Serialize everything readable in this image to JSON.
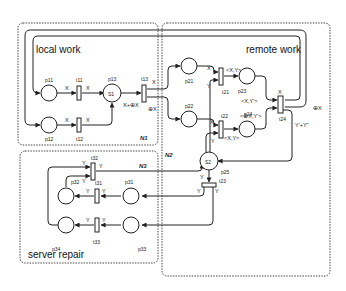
{
  "regions": {
    "local_work": "local work",
    "remote_work": "remote work",
    "server_repair": "server repair"
  },
  "nets": {
    "n1": "N1",
    "n2": "N2",
    "n3": "N3"
  },
  "places": {
    "p11": "p11",
    "p12": "p12",
    "p13": "p13",
    "p21": "p21",
    "p22": "p22",
    "p23": "p23",
    "p24": "p24",
    "p25": "p25",
    "p31": "p31",
    "p32": "p32",
    "p33": "p33",
    "p34": "p34"
  },
  "tokens": {
    "p13": "S1",
    "p25": "S2"
  },
  "transitions": {
    "t11": "t11",
    "t12": "t12",
    "t13": "t13",
    "t21": "t21",
    "t22": "t22",
    "t23": "t23",
    "t24": "t24",
    "t31": "t31",
    "t32": "t32",
    "t33": "t33"
  },
  "arc_labels": {
    "x": "X",
    "y": "Y",
    "xy": "<X,Y>",
    "xyp": "<X,Y'>",
    "oxy": "<⊕X,Y'>",
    "x_plus": "X+⊕X",
    "ox": "⊕X",
    "ypy": "Y'+Y\""
  }
}
